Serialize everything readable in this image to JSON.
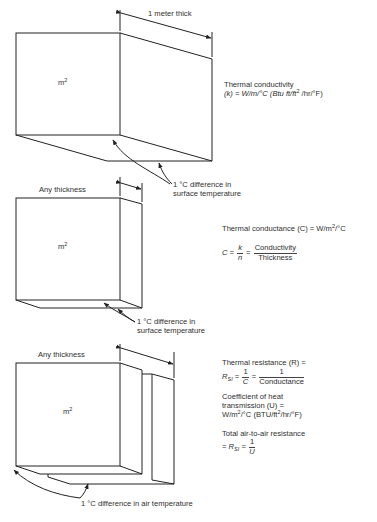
{
  "panels": [
    {
      "id": "conductivity",
      "face_label": "m",
      "face_label_sup": "2",
      "dimension_label": "1 meter thick",
      "callout_line1": "1 °C difference in",
      "callout_line2": "surface temperature",
      "definition": {
        "line1": "Thermal conductivity",
        "line2_prefix": "(k) = W/m/°C (Btu ft/ft",
        "line2_sup": "2",
        "line2_suffix": " /hr/°F)"
      }
    },
    {
      "id": "conductance",
      "face_label": "m",
      "face_label_sup": "2",
      "dimension_label": "Any thickness",
      "callout_line1": "1 °C difference in",
      "callout_line2": "surface temperature",
      "definition": {
        "line1_prefix": "Thermal conductance (C) = W/m",
        "line1_sup": "2",
        "line1_suffix": "/°C",
        "formula_lhs": "C =",
        "formula_frac1_num": "k",
        "formula_frac1_den": "n",
        "formula_eq": "=",
        "formula_frac2_num": "Conductivity",
        "formula_frac2_den": "Thickness"
      }
    },
    {
      "id": "resistance",
      "face_label": "m",
      "face_label_sup": "2",
      "dimension_label": "Any thickness",
      "callout": "1 °C difference in air temperature",
      "definition": {
        "line1": "Thermal resistance (R) =",
        "formula_lhs": "R",
        "formula_lhs_sub": "SI",
        "formula_eq1": "=",
        "formula_frac1_num": "1",
        "formula_frac1_den": "C",
        "formula_eq2": "=",
        "formula_frac2_num": "1",
        "formula_frac2_den": "Conductance",
        "coef_line1": "Coefficient of heat",
        "coef_line2": "transmission (U) =",
        "coef_line3_prefix": "W/m",
        "coef_line3_sup": "2",
        "coef_line3_mid": "/°C (BTU/ft",
        "coef_line3_sup2": "2",
        "coef_line3_suffix": "/hr/°F)",
        "total_line1": "Total air-to-air resistance",
        "total_eq1": "=",
        "total_lhs": "R",
        "total_lhs_sub": "SI",
        "total_eq2": "=",
        "total_frac_num": "1",
        "total_frac_den": "U"
      }
    }
  ]
}
